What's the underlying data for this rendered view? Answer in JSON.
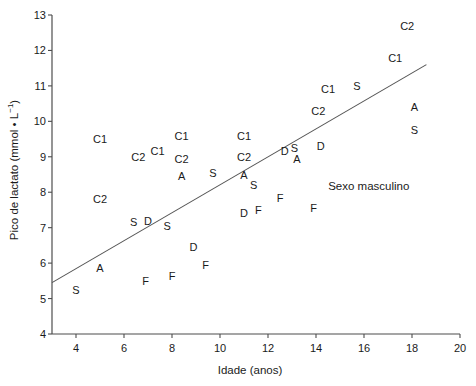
{
  "chart_data": {
    "type": "scatter",
    "title": "",
    "xlabel": "Idade (anos)",
    "ylabel": "Pico de lactato (mmol • L⁻¹)",
    "xlim": [
      3,
      20
    ],
    "ylim": [
      4,
      13
    ],
    "xticks": [
      4,
      6,
      8,
      10,
      12,
      14,
      16,
      18,
      20
    ],
    "yticks": [
      4,
      5,
      6,
      7,
      8,
      9,
      10,
      11,
      12,
      13
    ],
    "grid": false,
    "legend": "none",
    "annotation": "Sexo masculino",
    "marker_style": "text-letter",
    "trendline": {
      "type": "linear",
      "x_start": 3.0,
      "y_start": 5.45,
      "x_end": 18.6,
      "y_end": 11.6,
      "slope": 0.394,
      "intercept": 4.27
    },
    "points": [
      {
        "label": "C1",
        "x": 5.0,
        "y": 9.5
      },
      {
        "label": "C2",
        "x": 5.0,
        "y": 7.8
      },
      {
        "label": "S",
        "x": 4.0,
        "y": 5.25
      },
      {
        "label": "A",
        "x": 5.0,
        "y": 5.85
      },
      {
        "label": "S",
        "x": 6.4,
        "y": 7.15
      },
      {
        "label": "D",
        "x": 7.0,
        "y": 7.2
      },
      {
        "label": "C2",
        "x": 6.6,
        "y": 9.0
      },
      {
        "label": "C1",
        "x": 7.4,
        "y": 9.15
      },
      {
        "label": "F",
        "x": 6.9,
        "y": 5.5
      },
      {
        "label": "C1",
        "x": 8.4,
        "y": 9.6
      },
      {
        "label": "C2",
        "x": 8.4,
        "y": 8.95
      },
      {
        "label": "A",
        "x": 8.4,
        "y": 8.45
      },
      {
        "label": "S",
        "x": 7.8,
        "y": 7.05
      },
      {
        "label": "D",
        "x": 8.9,
        "y": 6.45
      },
      {
        "label": "S",
        "x": 9.7,
        "y": 8.55
      },
      {
        "label": "F",
        "x": 9.4,
        "y": 5.95
      },
      {
        "label": "F",
        "x": 8.0,
        "y": 5.65
      },
      {
        "label": "C1",
        "x": 11.0,
        "y": 9.6
      },
      {
        "label": "C2",
        "x": 11.0,
        "y": 9.0
      },
      {
        "label": "A",
        "x": 11.0,
        "y": 8.5
      },
      {
        "label": "S",
        "x": 11.4,
        "y": 8.2
      },
      {
        "label": "D",
        "x": 11.0,
        "y": 7.4
      },
      {
        "label": "F",
        "x": 11.6,
        "y": 7.5
      },
      {
        "label": "F",
        "x": 12.5,
        "y": 7.85
      },
      {
        "label": "D",
        "x": 12.7,
        "y": 9.15
      },
      {
        "label": "S",
        "x": 13.1,
        "y": 9.25
      },
      {
        "label": "A",
        "x": 13.2,
        "y": 8.95
      },
      {
        "label": "D",
        "x": 14.2,
        "y": 9.3
      },
      {
        "label": "C2",
        "x": 14.1,
        "y": 10.3
      },
      {
        "label": "F",
        "x": 13.9,
        "y": 7.55
      },
      {
        "label": "C1",
        "x": 14.5,
        "y": 10.9
      },
      {
        "label": "S",
        "x": 15.7,
        "y": 11.0
      },
      {
        "label": "C1",
        "x": 17.3,
        "y": 11.8
      },
      {
        "label": "C2",
        "x": 17.8,
        "y": 12.7
      },
      {
        "label": "A",
        "x": 18.1,
        "y": 10.4
      },
      {
        "label": "S",
        "x": 18.1,
        "y": 9.75
      }
    ]
  },
  "axes": {
    "x_tick_labels": [
      "4",
      "6",
      "8",
      "10",
      "12",
      "14",
      "16",
      "18",
      "20"
    ],
    "y_tick_labels": [
      "4",
      "5",
      "6",
      "7",
      "8",
      "9",
      "10",
      "11",
      "12",
      "13"
    ],
    "x_axis_title": "Idade (anos)",
    "y_axis_title_main": "Pico de lactato (mmol • L",
    "y_axis_title_sup": "−1",
    "y_axis_title_tail": ")"
  },
  "annotation": {
    "text": "Sexo masculino"
  },
  "colors": {
    "axis": "#4d4d4d",
    "text": "#1a1a1a",
    "line": "#555555",
    "background": "#ffffff"
  }
}
